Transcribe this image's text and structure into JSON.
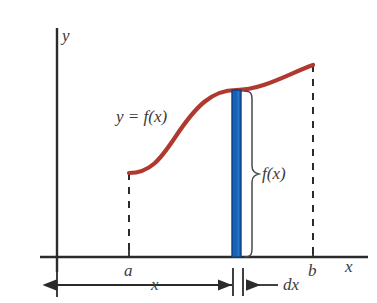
{
  "figure": {
    "kind": "calculus-area-under-curve-diagram",
    "background_color": "#ffffff"
  },
  "axes": {
    "y_axis_label": "y",
    "x_axis_label": "x",
    "axis_color": "#2b2b2b",
    "origin_px": {
      "x": 57,
      "y": 257
    },
    "y_axis_top_px": 28,
    "x_axis_right_px": 338
  },
  "curve": {
    "label": "y = f(x)",
    "color": "#b0392f",
    "shape": "sigmoid",
    "start_point_px": {
      "x": 129,
      "y": 173
    },
    "end_point_px": {
      "x": 313,
      "y": 65
    },
    "stroke_width": 4
  },
  "strip": {
    "name": "representative-rectangle",
    "fill_color": "#1663b4",
    "edge_color": "#0d3f82",
    "left_px": 232,
    "width_px": 9,
    "top_px": 90,
    "bottom_px": 257,
    "height_label": "f(x)",
    "width_label": "dx"
  },
  "marks": {
    "tick_a_label": "a",
    "tick_b_label": "b",
    "dimension_label": "x",
    "height_brace_label": "f(x)",
    "width_arrow_label": "dx"
  },
  "ticks": {
    "a_px": 129,
    "strip_px": 236,
    "b_px": 313
  },
  "dimension_line": {
    "y_px": 285,
    "from_px": 57,
    "to_px": 232,
    "label": "x"
  },
  "dx_arrow": {
    "y_px": 285,
    "from_px": 278,
    "to_px": 244,
    "label": "dx"
  }
}
